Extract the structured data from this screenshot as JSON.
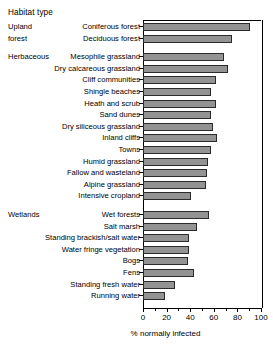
{
  "axis_title_top": "Habitat type",
  "xaxis_label": "% normally infected",
  "colors": {
    "bar_fill": "#939393",
    "bar_stroke": "#2b2b2b",
    "axis": "#000000"
  },
  "groups": [
    {
      "name": "Upland forest",
      "lines": [
        "Upland",
        "forest"
      ]
    },
    {
      "name": "Herbaceous",
      "lines": [
        "Herbaceous"
      ]
    },
    {
      "name": "Wetlands",
      "lines": [
        "Wetlands"
      ]
    }
  ],
  "chart_data": {
    "type": "bar",
    "orientation": "horizontal",
    "title": "",
    "xlabel": "% normally infected",
    "ylabel": "Habitat type",
    "xlim": [
      0,
      100
    ],
    "xticks": [
      0,
      20,
      40,
      60,
      80,
      100
    ],
    "minor_xticks": [
      10,
      30,
      50,
      70,
      90
    ],
    "grid": false,
    "legend": null,
    "categories": [
      "Coniferous forest",
      "Deciduous forest",
      "Mesophile grassland",
      "Dry calcareous grassland",
      "Cliff communities",
      "Shingle beaches",
      "Heath and scrub",
      "Sand dunes",
      "Dry siliceous grassland",
      "Inland cliffs",
      "Towns",
      "Humid grassland",
      "Fallow and wasteland",
      "Alpine grassland",
      "Intensive cropland",
      "Wet forests",
      "Salt marsh",
      "Standing brackish/salt water",
      "Water fringe vegetation",
      "Bogs",
      "Fens",
      "Standing fresh water",
      "Running water"
    ],
    "values": [
      91,
      75,
      69,
      72,
      62,
      58,
      62,
      58,
      59,
      63,
      58,
      55,
      54,
      53,
      41,
      56,
      46,
      39,
      39,
      38,
      43,
      27,
      19
    ],
    "group_of_category": [
      "Upland forest",
      "Upland forest",
      "Herbaceous",
      "Herbaceous",
      "Herbaceous",
      "Herbaceous",
      "Herbaceous",
      "Herbaceous",
      "Herbaceous",
      "Herbaceous",
      "Herbaceous",
      "Herbaceous",
      "Herbaceous",
      "Herbaceous",
      "Herbaceous",
      "Wetlands",
      "Wetlands",
      "Wetlands",
      "Wetlands",
      "Wetlands",
      "Wetlands",
      "Wetlands",
      "Wetlands"
    ]
  }
}
